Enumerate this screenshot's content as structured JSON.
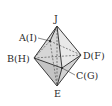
{
  "diagram": {
    "type": "octahedron",
    "vertices": {
      "J": {
        "label": "J",
        "x": 57,
        "y": 26
      },
      "A": {
        "label": "A(I)",
        "x": 50,
        "y": 41
      },
      "B": {
        "label": "B(H)",
        "x": 34,
        "y": 58
      },
      "D": {
        "label": "D(F)",
        "x": 81,
        "y": 55
      },
      "C": {
        "label": "C(G)",
        "x": 62,
        "y": 68
      },
      "E": {
        "label": "E",
        "x": 57,
        "y": 86
      }
    },
    "labels": [
      {
        "text": "J",
        "x": 54,
        "y": 22
      },
      {
        "text": "A(I)",
        "x": 19,
        "y": 41
      },
      {
        "text": "B(H)",
        "x": 7,
        "y": 62
      },
      {
        "text": "D(F)",
        "x": 83,
        "y": 59
      },
      {
        "text": "C(G)",
        "x": 76,
        "y": 79
      },
      {
        "text": "E",
        "x": 54,
        "y": 97
      }
    ],
    "colors": {
      "face_light": "#e4e4e4",
      "face_dark": "#c8c8c8",
      "edge": "#3a3a3a"
    }
  }
}
